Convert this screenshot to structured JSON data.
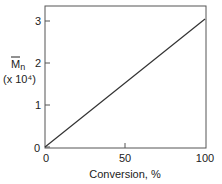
{
  "chart_data": {
    "type": "line",
    "title": "",
    "xlabel": "Conversion, %",
    "ylabel": "Mn",
    "ylabel_overbar": true,
    "ylabel_subscript": "n",
    "ylabel_main": "M",
    "ylabel_scale": "(x 10⁴)",
    "xlim": [
      0,
      100
    ],
    "ylim": [
      0,
      3.3
    ],
    "xticks": [
      0,
      50,
      100
    ],
    "xtick_labels": [
      "0",
      "50",
      "100"
    ],
    "yticks": [
      0,
      1,
      2,
      3
    ],
    "ytick_labels": [
      "0",
      "1",
      "2",
      "3"
    ],
    "grid": false,
    "legend": null,
    "series": [
      {
        "name": "Mn vs conversion",
        "x": [
          0,
          100
        ],
        "y": [
          0,
          3.05
        ],
        "color": "#333333"
      }
    ]
  }
}
